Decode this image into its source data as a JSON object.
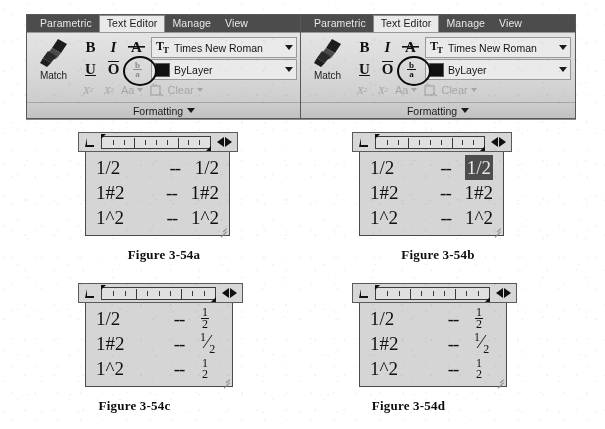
{
  "ribbon": {
    "tabs": [
      {
        "label": "Parametric",
        "active": false
      },
      {
        "label": "Text Editor",
        "active": true
      },
      {
        "label": "Manage",
        "active": false
      },
      {
        "label": "View",
        "active": false
      }
    ],
    "match_label": "Match",
    "match_icon": "match-properties-brush-icon",
    "buttons": {
      "bold": "B",
      "italic": "I",
      "strikethrough": "A",
      "underline": "U",
      "overline": "O",
      "stack_numerator": "b",
      "stack_denominator": "a",
      "superscript": "X",
      "subscript": "X",
      "case": "Aa",
      "clear": "Clear"
    },
    "font_dropdown": {
      "icon": "font-tt-icon",
      "value": "Times New Roman"
    },
    "color_dropdown": {
      "icon": "color-swatch-icon",
      "swatch_color": "#111111",
      "value": "ByLayer"
    },
    "panel_label": "Formatting"
  },
  "figures": [
    {
      "id": "a",
      "caption": "Figure 3-54a",
      "stack_button_active": false,
      "annotated": true,
      "lines": [
        {
          "left": "1/2",
          "dash": "--",
          "right_type": "plain",
          "right": "1/2",
          "selected": false
        },
        {
          "left": "1#2",
          "dash": "--",
          "right_type": "plain",
          "right": "1#2",
          "selected": false
        },
        {
          "left": "1^2",
          "dash": "--",
          "right_type": "plain",
          "right": "1^2",
          "selected": false
        }
      ]
    },
    {
      "id": "b",
      "caption": "Figure 3-54b",
      "stack_button_active": true,
      "annotated": true,
      "lines": [
        {
          "left": "1/2",
          "dash": "--",
          "right_type": "plain",
          "right": "1/2",
          "selected": true
        },
        {
          "left": "1#2",
          "dash": "--",
          "right_type": "plain",
          "right": "1#2",
          "selected": false
        },
        {
          "left": "1^2",
          "dash": "--",
          "right_type": "plain",
          "right": "1^2",
          "selected": false
        }
      ]
    },
    {
      "id": "c",
      "caption": "Figure 3-54c",
      "has_ribbon": false,
      "lines": [
        {
          "left": "1/2",
          "dash": "--",
          "right_type": "frac-bar",
          "numerator": "1",
          "denominator": "2",
          "selected": false
        },
        {
          "left": "1#2",
          "dash": "--",
          "right_type": "frac-slash",
          "numerator": "1",
          "denominator": "2",
          "selected": false
        },
        {
          "left": "1^2",
          "dash": "--",
          "right_type": "frac-nobar",
          "numerator": "1",
          "denominator": "2",
          "selected": false
        }
      ]
    },
    {
      "id": "d",
      "caption": "Figure 3-54d",
      "has_ribbon": false,
      "lines": [
        {
          "left": "1/2",
          "dash": "--",
          "right_type": "frac-bar",
          "numerator": "1",
          "denominator": "2",
          "selected": false
        },
        {
          "left": "1#2",
          "dash": "--",
          "right_type": "frac-slash",
          "numerator": "1",
          "denominator": "2",
          "selected": false
        },
        {
          "left": "1^2",
          "dash": "--",
          "right_type": "frac-nobar",
          "numerator": "1",
          "denominator": "2",
          "selected": false
        }
      ]
    }
  ]
}
